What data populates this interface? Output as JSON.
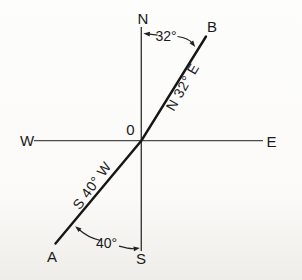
{
  "figure": {
    "type": "compass-bearing-diagram",
    "colors": {
      "background": "#fbfaf8",
      "axis": "#4a4a4a",
      "main_line": "#161616",
      "text": "#1a1a1a"
    },
    "compass": {
      "north": "N",
      "south": "S",
      "east": "E",
      "west": "W"
    },
    "origin": "0",
    "points": {
      "a": "A",
      "b": "B"
    },
    "angles": {
      "north_angle": "32°",
      "south_angle": "40°"
    },
    "bearings": {
      "ob": "N 32° E",
      "oa": "S 40° W"
    }
  }
}
